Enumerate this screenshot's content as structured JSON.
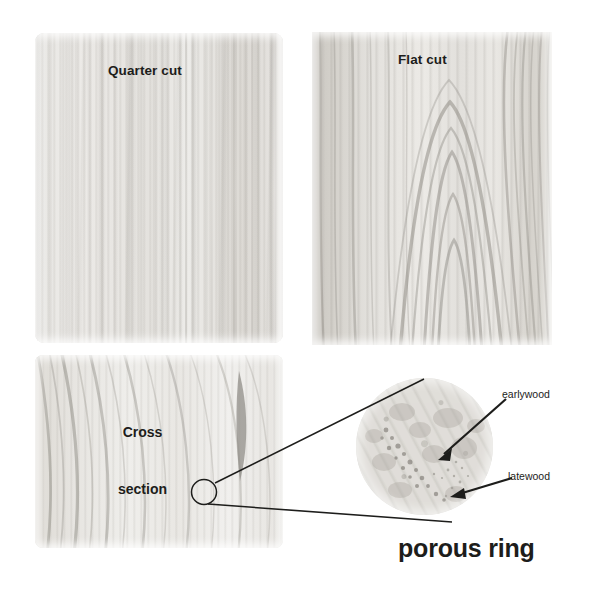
{
  "figure": {
    "background_color": "#ffffff",
    "line_color": "#1d1d1b",
    "text_color": "#1d1d1b",
    "width": 593,
    "height": 596
  },
  "panels": {
    "quarter": {
      "label": "Quarter cut",
      "grain": "straight fine vertical grain",
      "base_color": "#e6e5e2"
    },
    "flat": {
      "label": "Flat cut",
      "grain": "cathedral chevron grain",
      "base_color": "#e3e1dd"
    },
    "cross": {
      "label_line1": "Cross",
      "label_line2": "section",
      "grain": "curved growth rings",
      "base_color": "#e8e7e4"
    }
  },
  "inset": {
    "caption": "porous ring",
    "annotations": [
      {
        "label": "earlywood"
      },
      {
        "label": "latewood"
      }
    ],
    "magnified_from": "cross section",
    "base_color": "#e0ded9"
  }
}
